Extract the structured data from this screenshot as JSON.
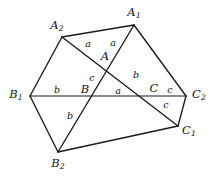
{
  "figure": {
    "type": "geometry-diagram",
    "stroke_color": "#1a1a1a",
    "background_color": "#ffffff",
    "width": 216,
    "height": 176
  },
  "vertices": [
    {
      "id": "A1",
      "label": "A",
      "sub": "1",
      "x": 134,
      "y": 25,
      "label_x": 134,
      "label_y": 13
    },
    {
      "id": "A2",
      "label": "A",
      "sub": "2",
      "x": 62,
      "y": 37,
      "label_x": 57,
      "label_y": 26
    },
    {
      "id": "B1",
      "label": "B",
      "sub": "1",
      "x": 30,
      "y": 96,
      "label_x": 16,
      "label_y": 95
    },
    {
      "id": "B2",
      "label": "B",
      "sub": "2",
      "x": 58,
      "y": 152,
      "label_x": 58,
      "label_y": 164
    },
    {
      "id": "C1",
      "label": "C",
      "sub": "1",
      "x": 178,
      "y": 126,
      "label_x": 189,
      "label_y": 131
    },
    {
      "id": "C2",
      "label": "C",
      "sub": "2",
      "x": 186,
      "y": 96,
      "label_x": 199,
      "label_y": 95
    },
    {
      "id": "A",
      "label": "A",
      "sub": "",
      "x": 104,
      "y": 64,
      "label_x": 105,
      "label_y": 57
    },
    {
      "id": "B",
      "label": "B",
      "sub": "",
      "x": 90,
      "y": 96,
      "label_x": 85,
      "label_y": 90
    },
    {
      "id": "C",
      "label": "C",
      "sub": "",
      "x": 157,
      "y": 96,
      "label_x": 154,
      "label_y": 89
    }
  ],
  "edges": [
    {
      "id": "A2-A1",
      "from": "A2",
      "to": "A1",
      "weight": "thick"
    },
    {
      "id": "A1-C2",
      "from": "A1",
      "to": "C2",
      "weight": "thick"
    },
    {
      "id": "A2-B1",
      "from": "A2",
      "to": "B1",
      "weight": "thick"
    },
    {
      "id": "B1-B2",
      "from": "B1",
      "to": "B2",
      "weight": "thick"
    },
    {
      "id": "B2-C1",
      "from": "B2",
      "to": "C1",
      "weight": "thick"
    },
    {
      "id": "C1-C2",
      "from": "C1",
      "to": "C2",
      "weight": "thick"
    },
    {
      "id": "B1-C2",
      "from": "B1",
      "to": "C2",
      "weight": "thin"
    },
    {
      "id": "A2-C1",
      "from": "A2",
      "to": "C1",
      "weight": "thick"
    },
    {
      "id": "A1-B2",
      "from": "A1",
      "to": "B2",
      "weight": "thick"
    }
  ],
  "side_labels": [
    {
      "id": "a-upper-left",
      "text": "a",
      "x": 88,
      "y": 44
    },
    {
      "id": "a-upper-right",
      "text": "a",
      "x": 113,
      "y": 43
    },
    {
      "id": "c-mid-left",
      "text": "c",
      "x": 92,
      "y": 78
    },
    {
      "id": "b-mid-right",
      "text": "b",
      "x": 136,
      "y": 75
    },
    {
      "id": "b-base-left",
      "text": "b",
      "x": 57,
      "y": 90
    },
    {
      "id": "a-base-mid",
      "text": "a",
      "x": 118,
      "y": 91
    },
    {
      "id": "c-base-right",
      "text": "c",
      "x": 170,
      "y": 90
    },
    {
      "id": "c-below-right",
      "text": "c",
      "x": 166,
      "y": 105
    },
    {
      "id": "b-below-left",
      "text": "b",
      "x": 70,
      "y": 116
    }
  ]
}
